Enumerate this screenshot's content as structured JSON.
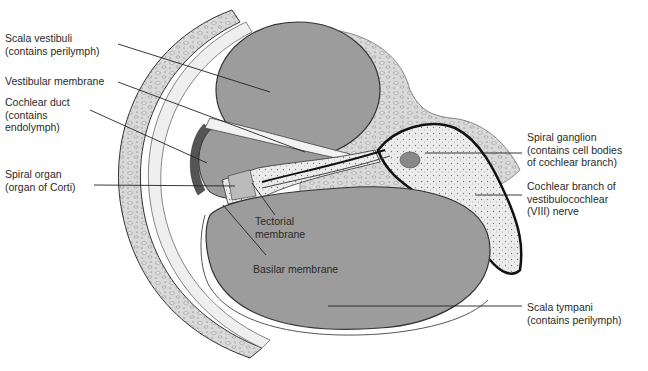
{
  "figure": {
    "colors": {
      "fluid": "#9c9c9c",
      "bone": "#d6d6d6",
      "tissue": "#e6e6e6",
      "ink": "#1e1e1e",
      "leader": "#222222",
      "text": "#2a2a2a"
    }
  },
  "labels": {
    "scala_vestibuli": {
      "line1": "Scala vestibuli",
      "line2": "(contains perilymph)"
    },
    "vestibular_membrane": {
      "line1": "Vestibular membrane"
    },
    "cochlear_duct": {
      "line1": "Cochlear duct",
      "line2": "(contains",
      "line3": "endolymph)"
    },
    "spiral_organ": {
      "line1": "Spiral organ",
      "line2": "(organ of Corti)"
    },
    "tectorial_membrane": {
      "line1": "Tectorial",
      "line2": "membrane"
    },
    "basilar_membrane": {
      "line1": "Basilar membrane"
    },
    "spiral_ganglion": {
      "line1": "Spiral ganglion",
      "line2": "(contains cell bodies",
      "line3": "of cochlear branch)"
    },
    "cochlear_branch": {
      "line1": "Cochlear branch of",
      "line2": "vestibulocochlear",
      "line3": "(VIII) nerve"
    },
    "scala_tympani": {
      "line1": "Scala tympani",
      "line2": "(contains perilymph)"
    }
  }
}
